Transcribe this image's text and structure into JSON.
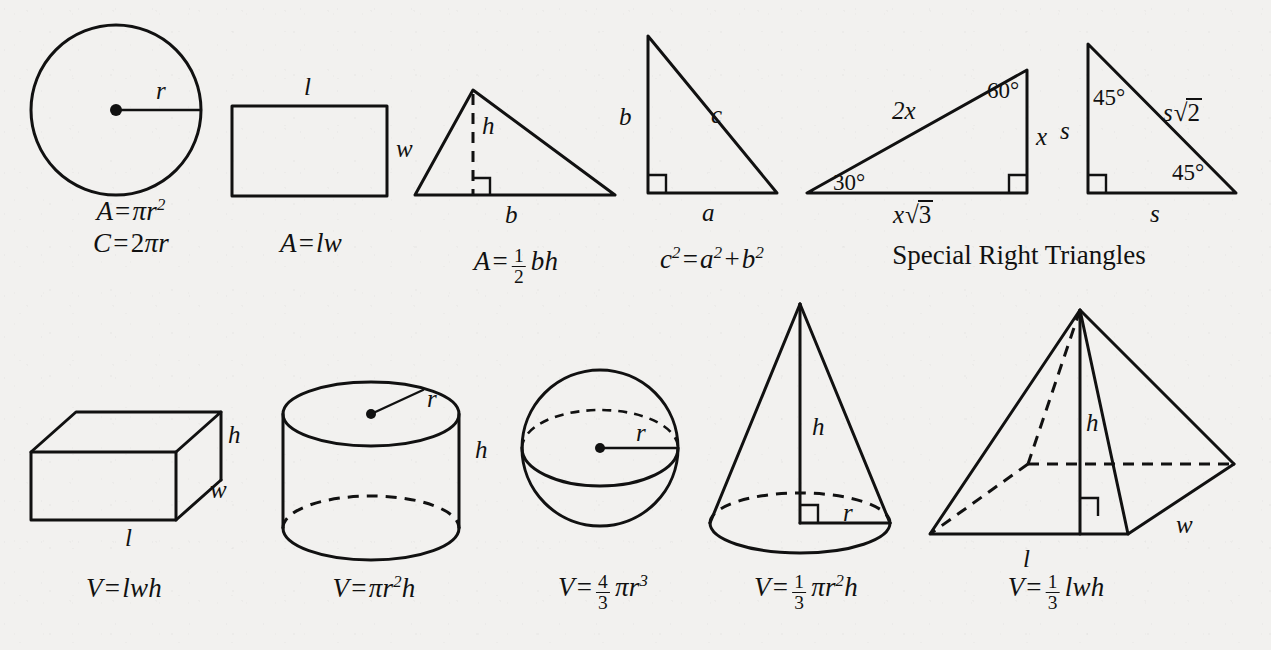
{
  "document": {
    "type": "geometry-formula-reference-sheet",
    "background_color": "#f2f1ef",
    "ink_color": "#111111"
  },
  "captions": {
    "special_right_triangles": "Special Right Triangles"
  },
  "figures": {
    "circle": {
      "name": "circle",
      "labels": {
        "radius": "r"
      }
    },
    "rectangle": {
      "name": "rectangle",
      "labels": {
        "length": "l",
        "width": "w"
      }
    },
    "triangle": {
      "name": "triangle",
      "labels": {
        "height": "h",
        "base": "b",
        "right_angle_marker": "right-angle"
      }
    },
    "right_triangle": {
      "name": "right-triangle",
      "labels": {
        "leg_a": "a",
        "leg_b": "b",
        "hypotenuse": "c",
        "right_angle_marker": "right-angle"
      }
    },
    "triangle_30_60_90": {
      "name": "30-60-90-triangle",
      "labels": {
        "angle_30": "30°",
        "angle_60": "60°",
        "hypotenuse": "2x",
        "short_leg": "x",
        "long_leg_coefficient": "x",
        "long_leg_radicand": "3",
        "radical_sign": "√",
        "long_leg": "x√3",
        "right_angle_marker": "right-angle"
      }
    },
    "triangle_45_45_90": {
      "name": "45-45-90-triangle",
      "labels": {
        "angle_top": "45°",
        "angle_bottom": "45°",
        "leg_vertical": "s",
        "leg_horizontal": "s",
        "hypotenuse_coefficient": "s",
        "hypotenuse_radicand": "2",
        "radical_sign": "√",
        "hypotenuse": "s√2",
        "right_angle_marker": "right-angle"
      }
    },
    "prism": {
      "name": "rectangular-prism",
      "labels": {
        "length": "l",
        "width": "w",
        "height": "h"
      }
    },
    "cylinder": {
      "name": "cylinder",
      "labels": {
        "radius": "r",
        "height": "h"
      }
    },
    "sphere": {
      "name": "sphere",
      "labels": {
        "radius": "r"
      }
    },
    "cone": {
      "name": "cone",
      "labels": {
        "radius": "r",
        "height": "h",
        "right_angle_marker": "right-angle"
      }
    },
    "pyramid": {
      "name": "rectangular-pyramid",
      "labels": {
        "length": "l",
        "width": "w",
        "height": "h",
        "right_angle_marker": "right-angle"
      }
    }
  },
  "formulas": {
    "equals": "=",
    "plus": "+",
    "pi": "π",
    "circle": {
      "area": {
        "lhs": "A",
        "var": "r",
        "exponent": "2",
        "text": "A = πr²"
      },
      "circumference": {
        "lhs": "C",
        "coefficient": "2",
        "var": "r",
        "text": "C = 2πr"
      }
    },
    "rectangle": {
      "area": {
        "lhs": "A",
        "rhs": "lw",
        "text": "A = lw"
      }
    },
    "triangle": {
      "area": {
        "lhs": "A",
        "numerator": "1",
        "denominator": "2",
        "rhs": "bh",
        "text": "A = ½ bh"
      }
    },
    "pythagorean": {
      "a": "a",
      "b": "b",
      "c": "c",
      "exponent": "2",
      "text": "c² = a² + b²"
    },
    "prism": {
      "volume": {
        "lhs": "V",
        "rhs": "lwh",
        "text": "V = lwh"
      }
    },
    "cylinder": {
      "volume": {
        "lhs": "V",
        "radius": "r",
        "exponent": "2",
        "height": "h",
        "text": "V = πr²h"
      }
    },
    "sphere": {
      "volume": {
        "lhs": "V",
        "numerator": "4",
        "denominator": "3",
        "radius": "r",
        "exponent": "3",
        "text": "V = 4/3 πr³"
      }
    },
    "cone": {
      "volume": {
        "lhs": "V",
        "numerator": "1",
        "denominator": "3",
        "radius": "r",
        "exponent": "2",
        "height": "h",
        "text": "V = 1/3 πr²h"
      }
    },
    "pyramid": {
      "volume": {
        "lhs": "V",
        "numerator": "1",
        "denominator": "3",
        "rhs": "lwh",
        "text": "V = 1/3 lwh"
      }
    }
  }
}
